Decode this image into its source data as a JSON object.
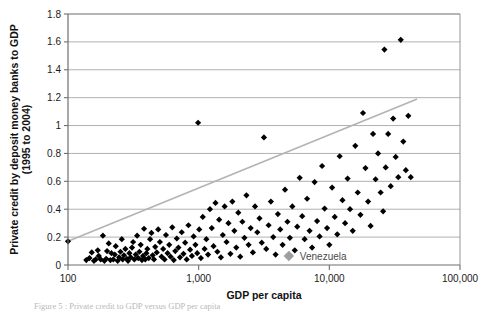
{
  "figure": {
    "caption": "Figure 5 : Private credit to GDP versus GDP per capita"
  },
  "chart_data": {
    "type": "scatter",
    "title": "",
    "xlabel": "GDP per capita",
    "ylabel": "Private credit by deposit money banks to GDP (1995 to 2004)",
    "ylabel_line1": "Private credit by deposit money banks to GDP",
    "ylabel_line2": "(1995 to 2004)",
    "xscale": "log",
    "yscale": "linear",
    "xlim": [
      100,
      100000
    ],
    "ylim": [
      0,
      1.8
    ],
    "grid": "horizontal",
    "legend": "none",
    "xticks": [
      100,
      1000,
      10000,
      100000
    ],
    "xtick_labels": [
      "100",
      "1,000",
      "10,000",
      "100,000"
    ],
    "yticks": [
      0,
      0.2,
      0.4,
      0.6,
      0.8,
      1,
      1.2,
      1.4,
      1.6,
      1.8
    ],
    "ytick_labels": [
      "0",
      "0.2",
      "0.4",
      "0.6",
      "0.8",
      "1",
      "1.2",
      "1.4",
      "1.6",
      "1.8"
    ],
    "marker": "diamond",
    "marker_color": "#000000",
    "trendline": {
      "color": "#b3b3b3",
      "x_start": 100,
      "y_start": 0.17,
      "x_end": 47000,
      "y_end": 1.19
    },
    "annotations": [
      {
        "label": "Venezuela",
        "x": 4900,
        "y": 0.065,
        "marker_color": "#9e9e9e",
        "text_color": "#6b6b6b"
      }
    ],
    "series": [
      {
        "name": "Countries",
        "color": "#000000",
        "points": [
          [
            100,
            0.17
          ],
          [
            138,
            0.035
          ],
          [
            146,
            0.05
          ],
          [
            152,
            0.09
          ],
          [
            158,
            0.03
          ],
          [
            163,
            0.04
          ],
          [
            169,
            0.105
          ],
          [
            172,
            0.065
          ],
          [
            178,
            0.04
          ],
          [
            185,
            0.21
          ],
          [
            190,
            0.03
          ],
          [
            196,
            0.045
          ],
          [
            199,
            0.1
          ],
          [
            205,
            0.155
          ],
          [
            211,
            0.035
          ],
          [
            215,
            0.085
          ],
          [
            222,
            0.04
          ],
          [
            228,
            0.075
          ],
          [
            232,
            0.135
          ],
          [
            240,
            0.03
          ],
          [
            246,
            0.055
          ],
          [
            252,
            0.095
          ],
          [
            258,
            0.185
          ],
          [
            262,
            0.04
          ],
          [
            268,
            0.07
          ],
          [
            275,
            0.115
          ],
          [
            282,
            0.045
          ],
          [
            288,
            0.03
          ],
          [
            295,
            0.085
          ],
          [
            302,
            0.055
          ],
          [
            309,
            0.125
          ],
          [
            315,
            0.165
          ],
          [
            322,
            0.04
          ],
          [
            330,
            0.075
          ],
          [
            338,
            0.21
          ],
          [
            345,
            0.05
          ],
          [
            352,
            0.095
          ],
          [
            360,
            0.145
          ],
          [
            368,
            0.035
          ],
          [
            375,
            0.065
          ],
          [
            382,
            0.26
          ],
          [
            390,
            0.04
          ],
          [
            398,
            0.085
          ],
          [
            405,
            0.115
          ],
          [
            415,
            0.05
          ],
          [
            425,
            0.185
          ],
          [
            435,
            0.23
          ],
          [
            445,
            0.07
          ],
          [
            455,
            0.04
          ],
          [
            465,
            0.13
          ],
          [
            478,
            0.09
          ],
          [
            490,
            0.255
          ],
          [
            505,
            0.165
          ],
          [
            520,
            0.06
          ],
          [
            535,
            0.115
          ],
          [
            548,
            0.04
          ],
          [
            562,
            0.215
          ],
          [
            578,
            0.085
          ],
          [
            595,
            0.145
          ],
          [
            610,
            0.06
          ],
          [
            628,
            0.27
          ],
          [
            645,
            0.035
          ],
          [
            662,
            0.1
          ],
          [
            680,
            0.19
          ],
          [
            700,
            0.125
          ],
          [
            720,
            0.055
          ],
          [
            742,
            0.235
          ],
          [
            765,
            0.08
          ],
          [
            788,
            0.16
          ],
          [
            810,
            0.04
          ],
          [
            835,
            0.285
          ],
          [
            860,
            0.11
          ],
          [
            888,
            0.065
          ],
          [
            915,
            0.205
          ],
          [
            945,
            0.145
          ],
          [
            975,
            0.085
          ],
          [
            990,
            1.02
          ],
          [
            1010,
            0.255
          ],
          [
            1040,
            0.05
          ],
          [
            1075,
            0.345
          ],
          [
            1110,
            0.115
          ],
          [
            1145,
            0.185
          ],
          [
            1180,
            0.075
          ],
          [
            1220,
            0.4
          ],
          [
            1260,
            0.265
          ],
          [
            1300,
            0.135
          ],
          [
            1345,
            0.445
          ],
          [
            1390,
            0.095
          ],
          [
            1435,
            0.325
          ],
          [
            1480,
            0.055
          ],
          [
            1530,
            0.215
          ],
          [
            1580,
            0.42
          ],
          [
            1635,
            0.165
          ],
          [
            1690,
            0.3
          ],
          [
            1750,
            0.08
          ],
          [
            1810,
            0.455
          ],
          [
            1875,
            0.245
          ],
          [
            1940,
            0.125
          ],
          [
            2010,
            0.375
          ],
          [
            2080,
            0.06
          ],
          [
            2160,
            0.31
          ],
          [
            2240,
            0.195
          ],
          [
            2320,
            0.5
          ],
          [
            2410,
            0.145
          ],
          [
            2500,
            0.265
          ],
          [
            2600,
            0.09
          ],
          [
            2700,
            0.42
          ],
          [
            2810,
            0.235
          ],
          [
            2920,
            0.335
          ],
          [
            3040,
            0.16
          ],
          [
            3160,
            0.915
          ],
          [
            3290,
            0.115
          ],
          [
            3430,
            0.285
          ],
          [
            3570,
            0.455
          ],
          [
            3720,
            0.2
          ],
          [
            3880,
            0.075
          ],
          [
            4040,
            0.365
          ],
          [
            4210,
            0.255
          ],
          [
            4390,
            0.145
          ],
          [
            4580,
            0.54
          ],
          [
            4780,
            0.31
          ],
          [
            4990,
            0.195
          ],
          [
            5210,
            0.42
          ],
          [
            5440,
            0.105
          ],
          [
            5680,
            0.275
          ],
          [
            5930,
            0.625
          ],
          [
            6200,
            0.35
          ],
          [
            6470,
            0.185
          ],
          [
            6760,
            0.475
          ],
          [
            7060,
            0.245
          ],
          [
            7380,
            0.125
          ],
          [
            7710,
            0.595
          ],
          [
            8060,
            0.315
          ],
          [
            8420,
            0.205
          ],
          [
            8800,
            0.71
          ],
          [
            9200,
            0.405
          ],
          [
            9610,
            0.265
          ],
          [
            10000,
            0.145
          ],
          [
            10500,
            0.555
          ],
          [
            11000,
            0.345
          ],
          [
            11500,
            0.22
          ],
          [
            12000,
            0.78
          ],
          [
            12600,
            0.465
          ],
          [
            13200,
            0.3
          ],
          [
            13800,
            0.62
          ],
          [
            14400,
            0.4
          ],
          [
            15100,
            0.245
          ],
          [
            15800,
            0.855
          ],
          [
            16500,
            0.52
          ],
          [
            17300,
            0.36
          ],
          [
            18100,
            1.09
          ],
          [
            18900,
            0.695
          ],
          [
            19800,
            0.455
          ],
          [
            20700,
            0.28
          ],
          [
            21600,
            0.94
          ],
          [
            22600,
            0.615
          ],
          [
            23600,
            0.8
          ],
          [
            24700,
            0.52
          ],
          [
            25800,
            0.385
          ],
          [
            26400,
            1.545
          ],
          [
            27000,
            0.7
          ],
          [
            28200,
            0.94
          ],
          [
            29500,
            0.565
          ],
          [
            30800,
            1.05
          ],
          [
            32200,
            0.775
          ],
          [
            33700,
            0.63
          ],
          [
            35200,
            1.615
          ],
          [
            36800,
            0.885
          ],
          [
            38500,
            0.68
          ],
          [
            40200,
            1.07
          ],
          [
            42000,
            0.63
          ]
        ]
      }
    ]
  }
}
